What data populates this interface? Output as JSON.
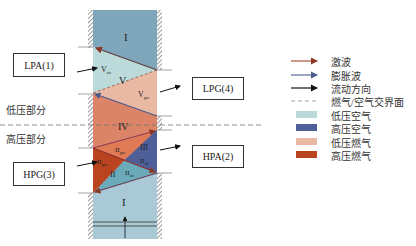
{
  "diagram": {
    "type": "wave-rotor channel wave diagram",
    "regions": [
      {
        "id": "I_top",
        "label": "I",
        "color": "#7fa6bb"
      },
      {
        "id": "V_lpa",
        "label": "V",
        "sub": "air",
        "color": "#bcdada"
      },
      {
        "id": "V",
        "label": "V",
        "color": "#bcdada"
      },
      {
        "id": "V_gas",
        "label": "V",
        "sub": "gas",
        "color": "#e9b9a4"
      },
      {
        "id": "IV",
        "label": "IV",
        "color": "#dc8468"
      },
      {
        "id": "III",
        "label": "III",
        "color": "#4e5f9a"
      },
      {
        "id": "II_gas_upper",
        "label": "II",
        "sub": "gas",
        "color": "#df7a55"
      },
      {
        "id": "II_gas_left",
        "label": "II",
        "sub": "gas",
        "color": "#b9441f"
      },
      {
        "id": "II_air",
        "label": "II",
        "sub": "air",
        "color": "#6aaabb"
      },
      {
        "id": "II",
        "label": "II",
        "color": "#b9441f"
      },
      {
        "id": "I_bottom",
        "label": "I",
        "color": "#a9c9d6"
      }
    ],
    "ports": [
      {
        "id": "LPA",
        "label": "LPA(1)"
      },
      {
        "id": "LPG",
        "label": "LPG(4)"
      },
      {
        "id": "HPA",
        "label": "HPA(2)"
      },
      {
        "id": "HPG",
        "label": "HPG(3)"
      }
    ],
    "side_labels": {
      "low_pressure": "低压部分",
      "high_pressure": "高压部分"
    }
  },
  "legend": {
    "items": [
      {
        "type": "arrow",
        "label": "激波",
        "color": "#b0553a"
      },
      {
        "type": "arrow",
        "label": "膨胀波",
        "color": "#5a6e9a"
      },
      {
        "type": "arrow",
        "label": "流动方向",
        "color": "#111111"
      },
      {
        "type": "dash",
        "label": "燃气/空气交界面",
        "color": "#888888"
      },
      {
        "type": "swatch",
        "label": "低压空气",
        "color": "#bcdada"
      },
      {
        "type": "swatch",
        "label": "高压空气",
        "color": "#4e5f9a"
      },
      {
        "type": "swatch",
        "label": "低压燃气",
        "color": "#e9b9a4"
      },
      {
        "type": "swatch",
        "label": "高压燃气",
        "color": "#b9441f"
      }
    ]
  }
}
